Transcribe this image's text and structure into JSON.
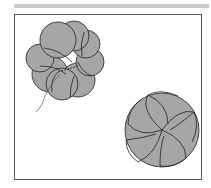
{
  "figure": {
    "colors": {
      "fill": "#a6a6a6",
      "stroke": "#222222",
      "frame": "#555555",
      "topbar": "#c9c9c9"
    },
    "items": [
      {
        "name": "rosette-in-progress",
        "cx": 63,
        "cy": 60,
        "r": 37,
        "has_thread": true
      },
      {
        "name": "rosette-finished",
        "cx": 162,
        "cy": 130,
        "r": 38,
        "has_thread": false
      }
    ]
  }
}
